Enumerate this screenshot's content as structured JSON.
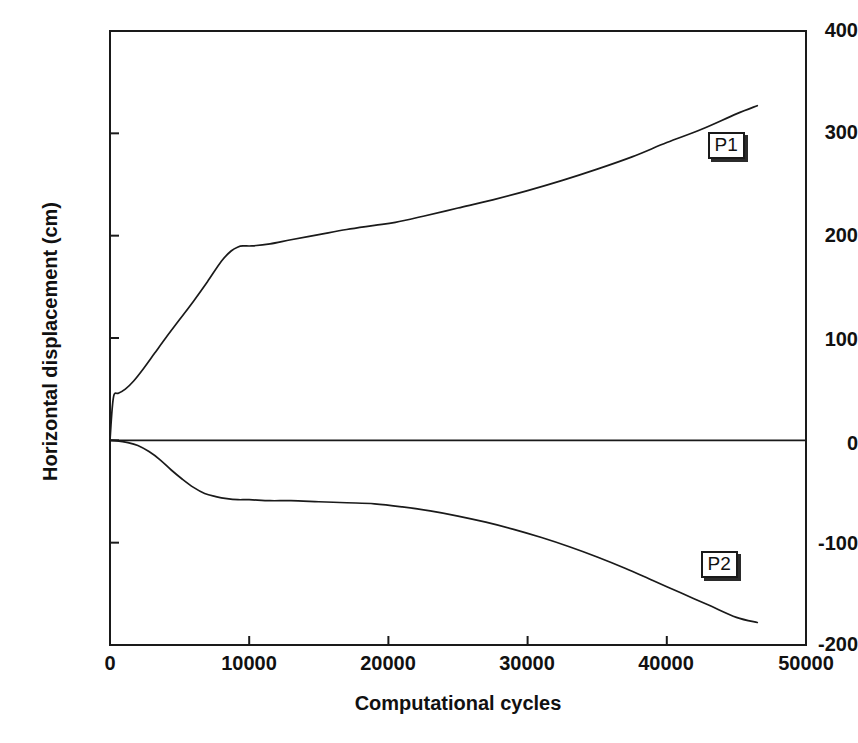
{
  "chart_data": {
    "type": "line",
    "title": "",
    "xlabel": "Computational cycles",
    "ylabel": "Horizontal displacement (cm)",
    "xlim": [
      0,
      50000
    ],
    "ylim": [
      -200,
      400
    ],
    "xticks": [
      0,
      10000,
      20000,
      30000,
      40000,
      50000
    ],
    "xtick_labels": [
      "0",
      "10000",
      "20000",
      "30000",
      "40000",
      "50000"
    ],
    "yticks": [
      -200,
      -100,
      0,
      100,
      200,
      300,
      400
    ],
    "ytick_labels": [
      "-200",
      "-100",
      "0",
      "100",
      "200",
      "300",
      "400"
    ],
    "grid": false,
    "legend_position": "inline-annotation",
    "line_color": "#1a1a1a",
    "axis_color": "#1a1a1a",
    "background": "#ffffff",
    "annotations": [
      {
        "text": "P1",
        "x": 43000,
        "y": 287
      },
      {
        "text": "P2",
        "x": 42500,
        "y": -123
      }
    ],
    "series": [
      {
        "name": "P1",
        "label": "P1",
        "x": [
          0,
          150,
          300,
          600,
          1100,
          1700,
          2400,
          3200,
          4000,
          5000,
          6000,
          7000,
          8000,
          8700,
          9200,
          9600,
          10200,
          11500,
          13000,
          15000,
          17000,
          19000,
          20500,
          22500,
          25000,
          27500,
          30000,
          32500,
          35000,
          37500,
          40000,
          42500,
          45000,
          46500
        ],
        "y": [
          0,
          30,
          45,
          46,
          50,
          58,
          70,
          85,
          100,
          118,
          136,
          155,
          175,
          185,
          189,
          190,
          190,
          192,
          196,
          201,
          206,
          210,
          213,
          219,
          227,
          235,
          244,
          254,
          265,
          277,
          291,
          304,
          319,
          327
        ]
      },
      {
        "name": "P2",
        "label": "P2",
        "x": [
          0,
          500,
          1200,
          2000,
          2800,
          3600,
          4400,
          5200,
          6000,
          6800,
          7600,
          8400,
          9200,
          10000,
          11500,
          13000,
          15000,
          17000,
          19000,
          21000,
          23000,
          25000,
          27000,
          29000,
          31000,
          33000,
          35000,
          37000,
          39000,
          41000,
          43000,
          45000,
          46500
        ],
        "y": [
          0,
          -0.5,
          -2,
          -5,
          -11,
          -19,
          -29,
          -38,
          -46,
          -52,
          -55,
          -57,
          -58,
          -58,
          -59,
          -59,
          -60,
          -61,
          -62,
          -65,
          -69,
          -74,
          -80,
          -87,
          -95,
          -104,
          -114,
          -125,
          -137,
          -149,
          -161,
          -173,
          -178
        ]
      }
    ]
  },
  "axes": {
    "frame": {
      "left": 110,
      "top": 31,
      "right": 806,
      "bottom": 645
    }
  }
}
